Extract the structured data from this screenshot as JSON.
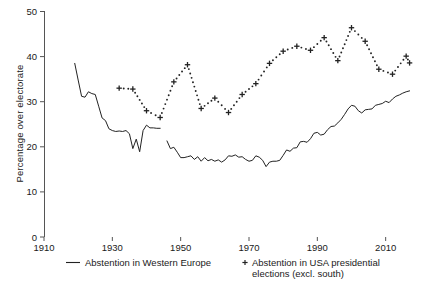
{
  "chart_data": {
    "type": "line",
    "title": "",
    "xlabel": "",
    "ylabel": "Percentage over electorate",
    "xlim": [
      1910,
      2018
    ],
    "ylim": [
      0,
      50
    ],
    "xticks": [
      1910,
      1930,
      1950,
      1970,
      1990,
      2010
    ],
    "xtick_labels": [
      "1910",
      "1930",
      "1950",
      "1970",
      "1990",
      "2010"
    ],
    "yticks": [
      0,
      10,
      20,
      30,
      40,
      50
    ],
    "ytick_labels": [
      "0",
      "10",
      "20",
      "30",
      "40",
      "50"
    ],
    "grid": false,
    "legend_position": "below",
    "series": [
      {
        "name": "Abstention in Western Europe",
        "marker": "none",
        "linestyle": "solid",
        "color": "#222222",
        "legend_label": "Abstention in Western Europe",
        "points": [
          [
            1919,
            38.5
          ],
          [
            1920,
            34.8
          ],
          [
            1921,
            31.2
          ],
          [
            1922,
            31.0
          ],
          [
            1923,
            32.2
          ],
          [
            1924,
            31.8
          ],
          [
            1925,
            31.6
          ],
          [
            1926,
            29.0
          ],
          [
            1927,
            26.4
          ],
          [
            1928,
            25.8
          ],
          [
            1929,
            24.0
          ],
          [
            1930,
            23.6
          ],
          [
            1931,
            23.4
          ],
          [
            1932,
            23.5
          ],
          [
            1933,
            23.4
          ],
          [
            1934,
            23.6
          ],
          [
            1935,
            22.9
          ],
          [
            1936,
            19.6
          ],
          [
            1937,
            21.7
          ],
          [
            1938,
            18.9
          ],
          [
            1939,
            23.6
          ],
          [
            1940,
            24.8
          ],
          [
            1941,
            24.2
          ],
          [
            1942,
            24.2
          ],
          [
            1943,
            24.1
          ],
          [
            1944,
            24.1
          ]
        ]
      },
      {
        "name": "Abstention in Western Europe (post-war)",
        "marker": "none",
        "linestyle": "solid",
        "color": "#222222",
        "legend_label": "",
        "points": [
          [
            1946,
            21.3
          ],
          [
            1947,
            19.6
          ],
          [
            1948,
            19.9
          ],
          [
            1949,
            18.8
          ],
          [
            1950,
            17.6
          ],
          [
            1951,
            17.6
          ],
          [
            1952,
            17.8
          ],
          [
            1953,
            18.0
          ],
          [
            1954,
            17.2
          ],
          [
            1955,
            17.8
          ],
          [
            1956,
            16.8
          ],
          [
            1957,
            17.6
          ],
          [
            1958,
            16.9
          ],
          [
            1959,
            17.2
          ],
          [
            1960,
            16.8
          ],
          [
            1961,
            17.1
          ],
          [
            1962,
            16.6
          ],
          [
            1963,
            17.1
          ],
          [
            1964,
            18.0
          ],
          [
            1965,
            17.9
          ],
          [
            1966,
            18.2
          ],
          [
            1967,
            17.7
          ],
          [
            1968,
            17.8
          ],
          [
            1969,
            17.2
          ],
          [
            1970,
            16.8
          ],
          [
            1971,
            17.0
          ],
          [
            1972,
            18.0
          ],
          [
            1973,
            17.7
          ],
          [
            1974,
            17.0
          ],
          [
            1975,
            15.6
          ],
          [
            1976,
            16.6
          ],
          [
            1977,
            16.8
          ],
          [
            1978,
            16.8
          ],
          [
            1979,
            17.0
          ],
          [
            1980,
            18.1
          ],
          [
            1981,
            19.3
          ],
          [
            1982,
            19.0
          ],
          [
            1983,
            19.7
          ],
          [
            1984,
            19.8
          ],
          [
            1985,
            21.1
          ],
          [
            1986,
            21.2
          ],
          [
            1987,
            21.0
          ],
          [
            1988,
            21.8
          ],
          [
            1989,
            23.0
          ],
          [
            1990,
            23.2
          ],
          [
            1991,
            22.6
          ],
          [
            1992,
            22.8
          ],
          [
            1993,
            23.8
          ],
          [
            1994,
            24.5
          ],
          [
            1995,
            24.6
          ],
          [
            1996,
            25.3
          ],
          [
            1997,
            26.1
          ],
          [
            1998,
            27.2
          ],
          [
            1999,
            28.4
          ],
          [
            2000,
            29.2
          ],
          [
            2001,
            29.0
          ],
          [
            2002,
            28.0
          ],
          [
            2003,
            27.5
          ],
          [
            2004,
            28.2
          ],
          [
            2005,
            28.3
          ],
          [
            2006,
            28.4
          ],
          [
            2007,
            29.2
          ],
          [
            2008,
            29.4
          ],
          [
            2009,
            29.6
          ],
          [
            2010,
            30.1
          ],
          [
            2011,
            29.8
          ],
          [
            2012,
            30.6
          ],
          [
            2013,
            31.2
          ],
          [
            2014,
            31.5
          ],
          [
            2015,
            31.9
          ],
          [
            2016,
            32.2
          ],
          [
            2017,
            32.4
          ]
        ]
      },
      {
        "name": "Abstention in USA presidential elections (excl. south)",
        "marker": "plus",
        "linestyle": "dotted",
        "color": "#222222",
        "legend_label": "Abstention in USA presidential elections (excl. south)",
        "points": [
          [
            1932,
            33.0
          ],
          [
            1936,
            32.8
          ],
          [
            1940,
            28.0
          ],
          [
            1944,
            26.5
          ],
          [
            1948,
            34.4
          ],
          [
            1952,
            38.2
          ],
          [
            1956,
            28.5
          ],
          [
            1960,
            30.8
          ],
          [
            1964,
            27.6
          ],
          [
            1968,
            31.6
          ],
          [
            1972,
            34.0
          ],
          [
            1976,
            38.5
          ],
          [
            1980,
            41.2
          ],
          [
            1984,
            42.3
          ],
          [
            1988,
            41.4
          ],
          [
            1992,
            44.2
          ],
          [
            1996,
            39.1
          ],
          [
            2000,
            46.4
          ],
          [
            2004,
            43.4
          ],
          [
            2008,
            37.2
          ],
          [
            2012,
            36.1
          ],
          [
            2016,
            40.1
          ],
          [
            2017,
            38.6
          ]
        ]
      }
    ],
    "legend": [
      {
        "label": "Abstention in Western Europe",
        "marker": "line",
        "name": "legend-western-europe"
      },
      {
        "label": "Abstention in USA presidential",
        "label_line2": "elections (excl. south)",
        "marker": "plus",
        "name": "legend-usa"
      }
    ]
  }
}
